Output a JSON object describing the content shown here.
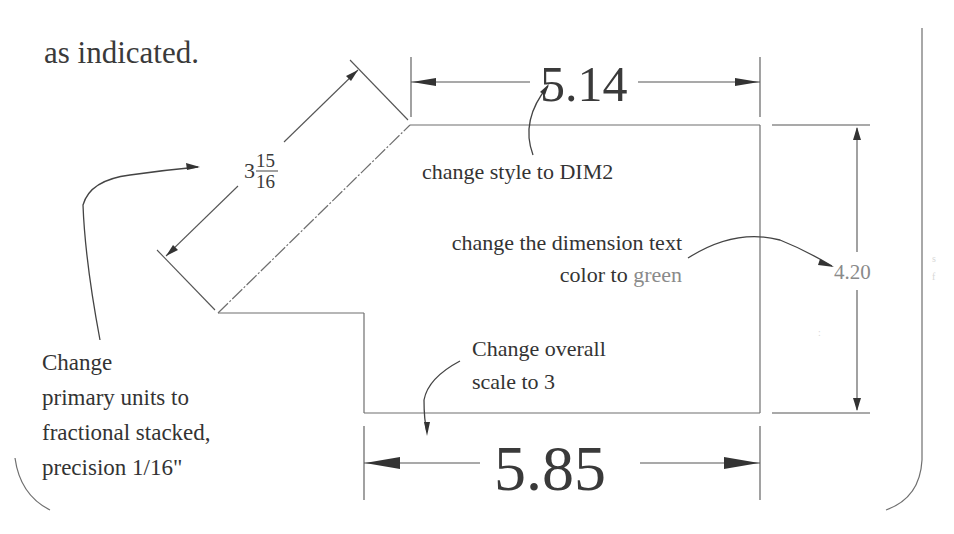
{
  "intro_text": "as indicated.",
  "dimensions": {
    "top": "5.14",
    "bottom": "5.85",
    "right": "4.20",
    "angled_whole": "3",
    "angled_numerator": "15",
    "angled_denominator": "16"
  },
  "notes": {
    "style": "change style to DIM2",
    "color_line1": "change the dimension text",
    "color_line2_prefix": "color to ",
    "color_line2_value": "green",
    "units_line1": "Change",
    "units_line2": "primary units to",
    "units_line3": "fractional stacked,",
    "units_line4": "precision 1/16\"",
    "scale_line1": "Change overall",
    "scale_line2": "scale to 3"
  },
  "colors": {
    "ink": "#333333",
    "green_text": "#8a8a8a",
    "geometry": "#6f6f6f"
  }
}
